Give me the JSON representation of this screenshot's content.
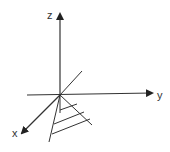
{
  "diagram": {
    "type": "3d-coordinate-axes",
    "axes": {
      "x": {
        "label": "x"
      },
      "y": {
        "label": "y"
      },
      "z": {
        "label": "z"
      }
    },
    "features": [
      "shaded triangular region below origin",
      "diagonal line through origin"
    ],
    "colors": {
      "stroke": "#222222",
      "background": "#ffffff"
    }
  }
}
